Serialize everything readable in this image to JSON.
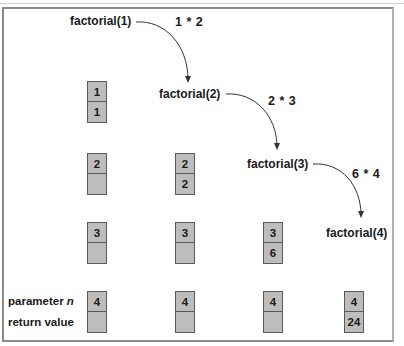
{
  "diagram": {
    "calls": [
      {
        "label": "factorial(1)"
      },
      {
        "label": "factorial(2)"
      },
      {
        "label": "factorial(3)"
      },
      {
        "label": "factorial(4)"
      }
    ],
    "multiplications": [
      {
        "label": "1 * 2"
      },
      {
        "label": "2 * 3"
      },
      {
        "label": "6 * 4"
      }
    ],
    "legend": {
      "parameter_prefix": "parameter ",
      "parameter_var": "n",
      "return_value": "return value"
    },
    "stacks": {
      "column_1": [
        {
          "param": "1",
          "ret": "1"
        },
        {
          "param": "2",
          "ret": ""
        },
        {
          "param": "3",
          "ret": ""
        },
        {
          "param": "4",
          "ret": ""
        }
      ],
      "column_2": [
        {
          "param": "2",
          "ret": "2"
        },
        {
          "param": "3",
          "ret": ""
        },
        {
          "param": "4",
          "ret": ""
        }
      ],
      "column_3": [
        {
          "param": "3",
          "ret": "6"
        },
        {
          "param": "4",
          "ret": ""
        }
      ],
      "column_4": [
        {
          "param": "4",
          "ret": "24"
        }
      ]
    },
    "colors": {
      "cell_fill": "#bdbdbd",
      "cell_border": "#5a5a5a",
      "frame_border": "#8a8a8a",
      "text": "#1a1a1a",
      "arrow": "#333333"
    }
  }
}
